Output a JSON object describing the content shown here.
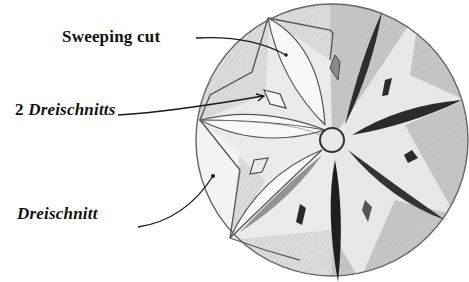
{
  "figure": {
    "labels": [
      {
        "id": "sweeping-cut",
        "text": "Sweeping cut",
        "style": "bold"
      },
      {
        "id": "two-dreischnitts",
        "text_prefix": "2 ",
        "text_italic": "Dreischnitts",
        "style": "bold"
      },
      {
        "id": "dreischnitt",
        "text": "Dreischnitt",
        "style": "bold-italic"
      }
    ],
    "colors": {
      "ink": "#1a1a1a",
      "pencil_line": "#555555",
      "shade_light": "#d9d9d9",
      "shade_mid": "#a8a8a8",
      "shade_dark": "#3a3a3a",
      "paper": "#ffffff"
    },
    "rosette": {
      "center": [
        332,
        140
      ],
      "radius": 136,
      "points": 6
    }
  }
}
